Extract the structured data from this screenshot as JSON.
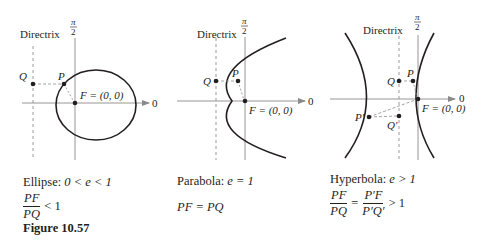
{
  "figure": {
    "label": "Figure 10.57",
    "panels": [
      {
        "name": "ellipse",
        "directrix_label": "Directrix",
        "axis_top_num": "π",
        "axis_top_den": "2",
        "axis_zero": "0",
        "point_Q": "Q",
        "point_P": "P",
        "focus_label": "F = (0, 0)",
        "caption_name": "Ellipse:",
        "caption_condition": "0 < e < 1",
        "ratio": {
          "num": "PF",
          "den": "PQ",
          "relation": "< 1"
        }
      },
      {
        "name": "parabola",
        "directrix_label": "Directrix",
        "axis_top_num": "π",
        "axis_top_den": "2",
        "axis_zero": "0",
        "point_Q": "Q",
        "point_P": "P",
        "focus_label": "F = (0, 0)",
        "caption_name": "Parabola:",
        "caption_condition": "e = 1",
        "equation": "PF = PQ"
      },
      {
        "name": "hyperbola",
        "directrix_label": "Directrix",
        "axis_top_num": "π",
        "axis_top_den": "2",
        "axis_zero": "0",
        "point_Q": "Q",
        "point_P": "P",
        "point_P_prime": "P′",
        "point_Q_prime": "Q′",
        "focus_label": "F = (0, 0)",
        "caption_name": "Hyperbola:",
        "caption_condition": "e > 1",
        "ratio": {
          "num": "PF",
          "den": "PQ",
          "eq": "=",
          "num2": "P′F",
          "den2": "P′Q′",
          "relation": "> 1"
        }
      }
    ]
  },
  "colors": {
    "ink": "#231f20",
    "axis": "#8a8a8a",
    "dashed": "#9a9a9a"
  }
}
